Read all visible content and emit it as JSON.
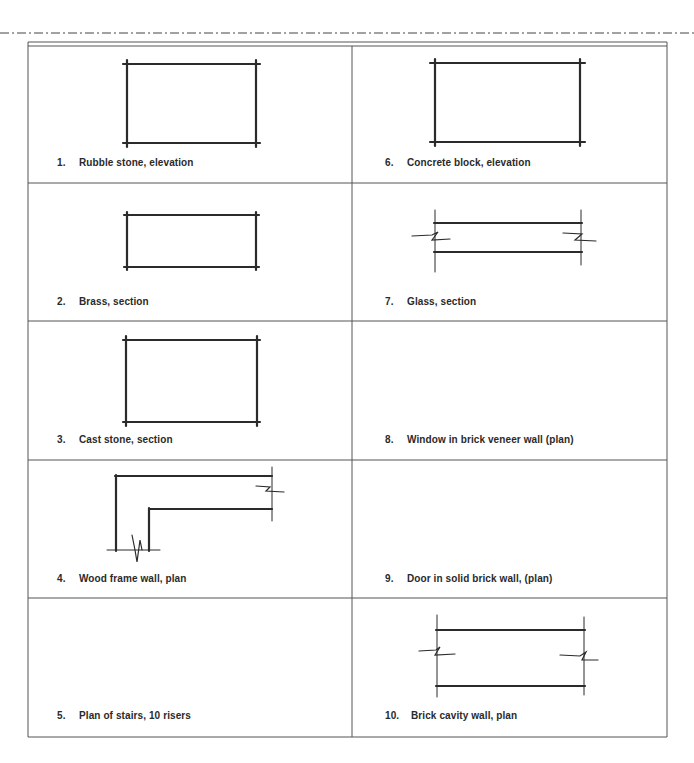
{
  "document": {
    "type": "architectural symbols exercise sheet",
    "panels": [
      {
        "number": "1.",
        "caption": "Rubble stone, elevation",
        "figure": "rectangle-crossed-corners"
      },
      {
        "number": "2.",
        "caption": "Brass, section",
        "figure": "rectangle-crossed-corners"
      },
      {
        "number": "3.",
        "caption": "Cast stone, section",
        "figure": "rectangle-crossed-corners"
      },
      {
        "number": "4.",
        "caption": "Wood frame wall, plan",
        "figure": "l-shaped-wall-with-breaks"
      },
      {
        "number": "5.",
        "caption": "Plan of stairs, 10 risers",
        "figure": "empty"
      },
      {
        "number": "6.",
        "caption": "Concrete block, elevation",
        "figure": "rectangle-crossed-corners"
      },
      {
        "number": "7.",
        "caption": "Glass, section",
        "figure": "parallel-lines-with-breaks"
      },
      {
        "number": "8.",
        "caption": "Window in brick veneer wall (plan)",
        "figure": "empty"
      },
      {
        "number": "9.",
        "caption": "Door in solid brick wall, (plan)",
        "figure": "empty"
      },
      {
        "number": "10.",
        "caption": "Brick cavity wall, plan",
        "figure": "parallel-lines-with-breaks"
      }
    ]
  },
  "colors": {
    "line": "#2b2b2b",
    "grid": "#555555",
    "paper": "#ffffff"
  }
}
